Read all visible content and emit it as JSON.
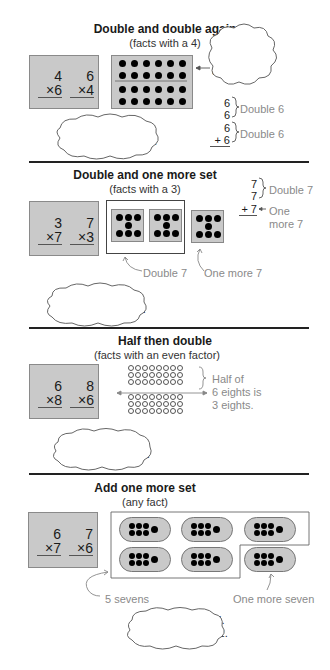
{
  "sections": [
    {
      "title": "Double and double again",
      "subtitle": "(facts with a 4)",
      "facts": [
        {
          "top": "4",
          "bottom": "×6"
        },
        {
          "top": "6",
          "bottom": "×4"
        }
      ],
      "cloud_top": "Double 6\nand\ndouble that.",
      "cloud_top_lines": [
        "Double 6",
        "and",
        "double that."
      ],
      "cloud_bottom_lines": [
        "Double 6 is 12.",
        "Double again is 24."
      ],
      "addition": [
        {
          "a": "6",
          "b": "6",
          "label": "Double 6"
        },
        {
          "a": "6",
          "b": "+ 6",
          "label": "Double 6"
        }
      ],
      "dot_rows": 4,
      "dot_cols": 6
    },
    {
      "title": "Double and one more set",
      "subtitle": "(facts with a 3)",
      "facts": [
        {
          "top": "3",
          "bottom": "×7"
        },
        {
          "top": "7",
          "bottom": "×3"
        }
      ],
      "addition": {
        "lines": [
          "7",
          "7",
          "+ 7"
        ],
        "double_label": "Double 7",
        "more_label_lines": [
          "One",
          "more 7"
        ]
      },
      "labels": {
        "double": "Double 7",
        "one_more": "One more 7"
      },
      "cloud_lines": [
        "Double 7 is 14.",
        "One more 7 is 21."
      ]
    },
    {
      "title": "Half then double",
      "subtitle": "(facts with an even factor)",
      "facts": [
        {
          "top": "6",
          "bottom": "×8"
        },
        {
          "top": "8",
          "bottom": "×6"
        }
      ],
      "ring_rows": 6,
      "ring_cols": 8,
      "half_label_lines": [
        "Half of",
        "6 eights is",
        "3 eights."
      ],
      "cloud_lines": [
        "3 times 8 is 24.",
        "Double 24 is 48."
      ]
    },
    {
      "title": "Add one more set",
      "subtitle": "(any fact)",
      "facts": [
        {
          "top": "6",
          "bottom": "×7"
        },
        {
          "top": "7",
          "bottom": "×6"
        }
      ],
      "labels": {
        "five": "5 sevens",
        "one_more": "One more seven"
      },
      "cloud_lines": [
        "5 sevens are 35.",
        "One more 7 is 42."
      ]
    }
  ]
}
